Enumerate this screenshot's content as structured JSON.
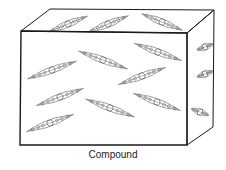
{
  "caption": "Compound",
  "colors": {
    "stroke": "#1a1a1a",
    "molecule": "#555555",
    "background": "#ffffff"
  },
  "box": {
    "front": [
      [
        21,
        31
      ],
      [
        187,
        33
      ],
      [
        187,
        145
      ],
      [
        20,
        145
      ]
    ],
    "top": [
      [
        21,
        31
      ],
      [
        50,
        9
      ],
      [
        214,
        10
      ],
      [
        187,
        33
      ]
    ],
    "side": [
      [
        187,
        33
      ],
      [
        214,
        10
      ],
      [
        213,
        127
      ],
      [
        187,
        145
      ]
    ]
  },
  "molecules": {
    "front": [
      {
        "cx": 103,
        "cy": 60,
        "angle": 20,
        "len": 52
      },
      {
        "cx": 158,
        "cy": 52,
        "angle": 20,
        "len": 50
      },
      {
        "cx": 52,
        "cy": 70,
        "angle": -20,
        "len": 52
      },
      {
        "cx": 142,
        "cy": 76,
        "angle": -20,
        "len": 50
      },
      {
        "cx": 60,
        "cy": 97,
        "angle": -20,
        "len": 50
      },
      {
        "cx": 110,
        "cy": 108,
        "angle": 20,
        "len": 52
      },
      {
        "cx": 157,
        "cy": 102,
        "angle": 20,
        "len": 50
      },
      {
        "cx": 50,
        "cy": 123,
        "angle": -20,
        "len": 50
      }
    ],
    "top": [
      {
        "cx": 68,
        "cy": 24,
        "angle": -22,
        "len": 42
      },
      {
        "cx": 108,
        "cy": 24,
        "angle": -22,
        "len": 44
      },
      {
        "cx": 162,
        "cy": 22,
        "angle": 22,
        "len": 44
      }
    ],
    "side": [
      {
        "cx": 205,
        "cy": 47,
        "angle": -20,
        "len": 22
      },
      {
        "cx": 205,
        "cy": 74,
        "angle": -20,
        "len": 22
      },
      {
        "cx": 200,
        "cy": 112,
        "angle": 20,
        "len": 24
      }
    ]
  }
}
